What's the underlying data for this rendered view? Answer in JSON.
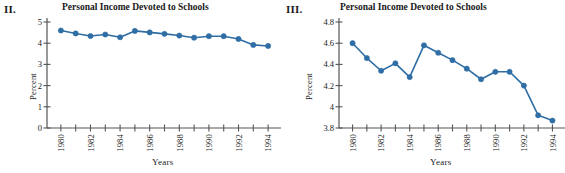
{
  "figure": {
    "panels": [
      {
        "panel_label": "II.",
        "title": "Personal Income Devoted to Schools",
        "ylabel": "Percent",
        "xlabel": "Years"
      },
      {
        "panel_label": "III.",
        "title": "Personal Income Devoted to Schools",
        "ylabel": "Percent",
        "xlabel": "Years"
      }
    ]
  },
  "style": {
    "series_color": "#2f6ea5",
    "axis_color": "#555555",
    "marker_color": "#2f6ea5",
    "background": "#ffffff"
  },
  "chart_data": [
    {
      "type": "line",
      "title": "Personal Income Devoted to Schools",
      "panel_label": "II.",
      "xlabel": "Years",
      "ylabel": "Percent",
      "x": [
        1980,
        1981,
        1982,
        1983,
        1984,
        1985,
        1986,
        1987,
        1988,
        1989,
        1990,
        1991,
        1992,
        1993,
        1994
      ],
      "values": [
        4.6,
        4.46,
        4.34,
        4.41,
        4.28,
        4.58,
        4.51,
        4.44,
        4.36,
        4.26,
        4.33,
        4.33,
        4.2,
        3.92,
        3.87
      ],
      "xtick_labels": [
        "1980",
        "1982",
        "1984",
        "1986",
        "1988",
        "1990",
        "1992",
        "1994"
      ],
      "xtick_values": [
        1980,
        1982,
        1984,
        1986,
        1988,
        1990,
        1992,
        1994
      ],
      "ytick_labels": [
        "0",
        "1",
        "2",
        "3",
        "4",
        "5"
      ],
      "ytick_values": [
        0,
        1,
        2,
        3,
        4,
        5
      ],
      "ylim": [
        0,
        5
      ],
      "xlim": [
        1979.4,
        1994.6
      ],
      "grid": false,
      "legend": "none",
      "marker": "circle",
      "series_name": "Percent of personal income devoted to schools"
    },
    {
      "type": "line",
      "title": "Personal Income Devoted to Schools",
      "panel_label": "III.",
      "xlabel": "Years",
      "ylabel": "Percent",
      "x": [
        1980,
        1981,
        1982,
        1983,
        1984,
        1985,
        1986,
        1987,
        1988,
        1989,
        1990,
        1991,
        1992,
        1993,
        1994
      ],
      "values": [
        4.6,
        4.46,
        4.34,
        4.41,
        4.28,
        4.58,
        4.51,
        4.44,
        4.36,
        4.26,
        4.33,
        4.33,
        4.2,
        3.92,
        3.87
      ],
      "xtick_labels": [
        "1980",
        "1982",
        "1984",
        "1986",
        "1988",
        "1990",
        "1992",
        "1994"
      ],
      "xtick_values": [
        1980,
        1982,
        1984,
        1986,
        1988,
        1990,
        1992,
        1994
      ],
      "ytick_labels": [
        "3.8",
        "4",
        "4.2",
        "4.4",
        "4.6",
        "4.8"
      ],
      "ytick_values": [
        3.8,
        4.0,
        4.2,
        4.4,
        4.6,
        4.8
      ],
      "ylim": [
        3.8,
        4.8
      ],
      "xlim": [
        1979.4,
        1994.6
      ],
      "grid": false,
      "legend": "none",
      "marker": "circle",
      "series_name": "Percent of personal income devoted to schools"
    }
  ]
}
